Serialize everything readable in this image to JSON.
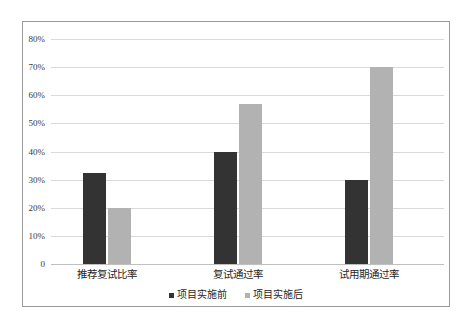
{
  "chart_data": {
    "type": "bar",
    "title": "",
    "subtitle": "",
    "xlabel": "",
    "ylabel": "",
    "categories": [
      "推荐复试比率",
      "复试通过率",
      "试用期通过率"
    ],
    "series": [
      {
        "name": "项目实施前",
        "color": "#333333",
        "values": [
          32.5,
          40,
          30
        ]
      },
      {
        "name": "项目实施后",
        "color": "#b2b2b2",
        "values": [
          20,
          57,
          70
        ]
      }
    ],
    "ylim": [
      0,
      80
    ],
    "y_ticks": [
      0,
      10,
      20,
      30,
      40,
      50,
      60,
      70,
      80
    ],
    "y_tick_labels": [
      "0",
      "10%",
      "20%",
      "30%",
      "40%",
      "50%",
      "60%",
      "70%",
      "80%"
    ],
    "grid": true,
    "legend_position": "bottom",
    "value_suffix": "%",
    "annotations": []
  },
  "frame": {
    "border_color": "#9a9a9a",
    "background": "#ffffff"
  }
}
